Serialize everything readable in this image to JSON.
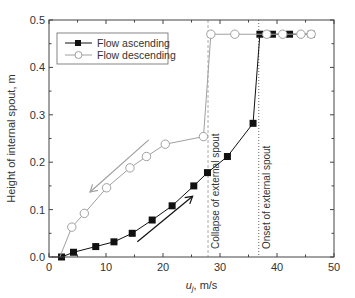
{
  "chart_data": {
    "type": "line",
    "title": "",
    "xlabel": "u_j, m/s",
    "xlabel_main": "u",
    "xlabel_sub": "j",
    "xlabel_unit": ", m/s",
    "ylabel": "Height of internal spout, m",
    "xlim": [
      0,
      50
    ],
    "ylim": [
      0.0,
      0.5
    ],
    "xticks": [
      0,
      10,
      20,
      30,
      40,
      50
    ],
    "xtick_labels": [
      "0",
      "10",
      "20",
      "30",
      "40",
      "50"
    ],
    "yticks": [
      0.0,
      0.1,
      0.2,
      0.3,
      0.4,
      0.5
    ],
    "ytick_labels": [
      "0.0",
      "0.1",
      "0.2",
      "0.3",
      "0.4",
      "0.5"
    ],
    "grid": false,
    "legend_position": "upper left",
    "series": [
      {
        "name": "Flow ascending",
        "marker": "filled-square",
        "color": "#111111",
        "x": [
          0.5,
          2.2,
          4.3,
          8.2,
          11.4,
          14.6,
          18.1,
          21.6,
          25.4,
          27.8,
          31.3,
          35.8,
          37.0,
          39.2,
          42.2,
          46.0
        ],
        "y": [
          0.0,
          0.0,
          0.01,
          0.022,
          0.032,
          0.05,
          0.078,
          0.108,
          0.15,
          0.178,
          0.212,
          0.282,
          0.47,
          0.47,
          0.47,
          0.47
        ]
      },
      {
        "name": "Flow descending",
        "marker": "open-circle",
        "color": "#a0a0a0",
        "x": [
          46.0,
          44.2,
          41.0,
          38.2,
          32.6,
          28.4,
          27.1,
          20.4,
          17.1,
          14.2,
          10.1,
          6.2,
          4.0,
          1.9
        ],
        "y": [
          0.47,
          0.47,
          0.47,
          0.47,
          0.47,
          0.47,
          0.254,
          0.238,
          0.212,
          0.188,
          0.146,
          0.092,
          0.063,
          0.0
        ]
      }
    ],
    "annotations": [
      {
        "text": "Collapse of external spout",
        "x": 27.9,
        "style": "dashed",
        "color": "#a0a0a0"
      },
      {
        "text": "Onset of external spout",
        "x": 36.8,
        "style": "dotted",
        "color": "#555555"
      }
    ],
    "arrows": [
      {
        "direction": "descending",
        "color": "#a0a0a0",
        "from": [
          17.5,
          0.247
        ],
        "to": [
          7.2,
          0.137
        ]
      },
      {
        "direction": "ascending",
        "color": "#111111",
        "from": [
          15.5,
          0.032
        ],
        "to": [
          25.2,
          0.128
        ]
      }
    ]
  }
}
